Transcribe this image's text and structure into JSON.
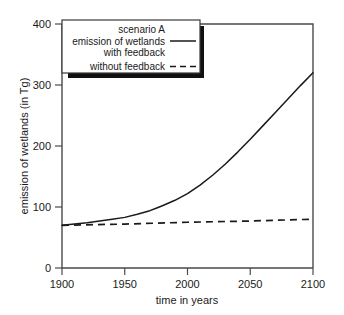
{
  "chart_data": {
    "type": "line",
    "title": "",
    "xlabel": "time in years",
    "ylabel": "emission of wetlands (in Tg)",
    "xlim": [
      1900,
      2100
    ],
    "ylim": [
      0,
      400
    ],
    "xticks": [
      1900,
      1950,
      2000,
      2050,
      2100
    ],
    "yticks": [
      0,
      100,
      200,
      300,
      400
    ],
    "grid": false,
    "legend_position": "top-left",
    "legend_title": "scenario A",
    "series": [
      {
        "name": "emission of wetlands with feedback",
        "style": "solid",
        "x": [
          1900,
          1910,
          1920,
          1930,
          1940,
          1950,
          1960,
          1970,
          1975,
          1980,
          1990,
          2000,
          2010,
          2020,
          2030,
          2040,
          2050,
          2060,
          2070,
          2080,
          2090,
          2100
        ],
        "values": [
          70,
          72,
          74,
          77,
          80,
          83,
          88,
          94,
          98,
          102,
          111,
          122,
          136,
          152,
          170,
          190,
          211,
          233,
          255,
          277,
          299,
          320
        ]
      },
      {
        "name": "without feedback",
        "style": "dashed",
        "x": [
          1900,
          1950,
          2000,
          2050,
          2100
        ],
        "values": [
          70,
          72,
          75,
          77,
          80
        ]
      }
    ]
  },
  "legend": {
    "scenario_label": "scenario A",
    "entry1_line1": "emission of wetlands",
    "entry1_line2": "with feedback",
    "entry2": "without feedback"
  },
  "axes": {
    "y_title": "emission of wetlands (in Tg)",
    "x_title": "time in years",
    "y_tick_labels": [
      "0",
      "100",
      "200",
      "300",
      "400"
    ],
    "x_tick_labels": [
      "1900",
      "1950",
      "2000",
      "2050",
      "2100"
    ]
  },
  "colors": {
    "series": "#1a1a1a",
    "axis": "#4a4a4a",
    "background": "#ffffff",
    "legend_shadow": "#111111"
  }
}
